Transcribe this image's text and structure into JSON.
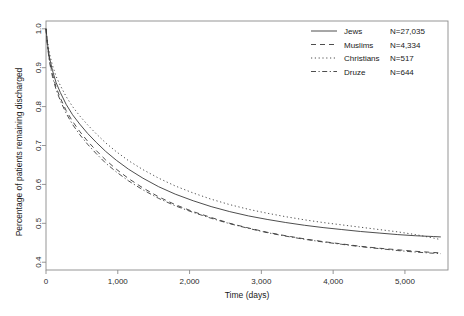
{
  "chart_data": {
    "type": "line",
    "title": "",
    "xlabel": "Time (days)",
    "ylabel": "Percentage of patients remaining discharged",
    "xlim": [
      0,
      5600
    ],
    "ylim": [
      0.38,
      1.02
    ],
    "grid": false,
    "legend_position": "top-right",
    "xticks": [
      0,
      1000,
      2000,
      3000,
      4000,
      5000
    ],
    "xtick_labels": [
      "0",
      "1,000",
      "2,000",
      "3,000",
      "4,000",
      "5,000"
    ],
    "yticks": [
      0.4,
      0.5,
      0.6,
      0.7,
      0.8,
      0.9,
      1.0
    ],
    "ytick_labels": [
      "0.4",
      "0.5",
      "0.6",
      "0.7",
      "0.8",
      "0.9",
      "1.0"
    ],
    "series": [
      {
        "name": "Jews",
        "n_label": "N=27,035",
        "n": 27035,
        "line_style": "solid",
        "color": "#3a3a3a",
        "x": [
          0,
          20,
          50,
          90,
          140,
          200,
          280,
          370,
          470,
          580,
          700,
          830,
          980,
          1150,
          1350,
          1570,
          1800,
          2050,
          2300,
          2560,
          2820,
          3080,
          3340,
          3600,
          3860,
          4120,
          4380,
          4640,
          4900,
          5150,
          5400,
          5500
        ],
        "y": [
          1.0,
          0.962,
          0.925,
          0.893,
          0.862,
          0.836,
          0.806,
          0.779,
          0.755,
          0.731,
          0.708,
          0.685,
          0.662,
          0.639,
          0.616,
          0.594,
          0.575,
          0.558,
          0.543,
          0.53,
          0.519,
          0.51,
          0.502,
          0.495,
          0.489,
          0.484,
          0.479,
          0.475,
          0.471,
          0.468,
          0.466,
          0.465
        ]
      },
      {
        "name": "Muslims",
        "n_label": "N=4,334",
        "n": 4334,
        "line_style": "dashed",
        "color": "#3a3a3a",
        "x": [
          0,
          20,
          50,
          90,
          140,
          200,
          280,
          370,
          470,
          580,
          700,
          830,
          980,
          1150,
          1350,
          1570,
          1800,
          2050,
          2300,
          2560,
          2820,
          3080,
          3340,
          3600,
          3860,
          4120,
          4380,
          4640,
          4900,
          5150,
          5400,
          5500
        ],
        "y": [
          1.0,
          0.958,
          0.918,
          0.883,
          0.85,
          0.822,
          0.79,
          0.762,
          0.736,
          0.711,
          0.687,
          0.663,
          0.639,
          0.615,
          0.591,
          0.568,
          0.548,
          0.53,
          0.515,
          0.5,
          0.488,
          0.477,
          0.468,
          0.46,
          0.453,
          0.447,
          0.441,
          0.436,
          0.432,
          0.428,
          0.425,
          0.424
        ]
      },
      {
        "name": "Christians",
        "n_label": "N=517",
        "n": 517,
        "line_style": "dotted",
        "color": "#3a3a3a",
        "x": [
          0,
          20,
          50,
          90,
          140,
          200,
          280,
          370,
          470,
          580,
          700,
          830,
          980,
          1150,
          1350,
          1570,
          1800,
          2050,
          2300,
          2560,
          2820,
          3080,
          3340,
          3600,
          3860,
          4120,
          4380,
          4640,
          4900,
          5150,
          5400,
          5500
        ],
        "y": [
          1.0,
          0.968,
          0.935,
          0.906,
          0.878,
          0.854,
          0.826,
          0.8,
          0.776,
          0.753,
          0.73,
          0.707,
          0.684,
          0.661,
          0.638,
          0.616,
          0.596,
          0.578,
          0.562,
          0.548,
          0.536,
          0.526,
          0.517,
          0.509,
          0.502,
          0.496,
          0.49,
          0.484,
          0.478,
          0.471,
          0.462,
          0.458
        ]
      },
      {
        "name": "Druze",
        "n_label": "N=644",
        "n": 644,
        "line_style": "dashdot",
        "color": "#3a3a3a",
        "x": [
          0,
          20,
          50,
          90,
          140,
          200,
          280,
          370,
          470,
          580,
          700,
          830,
          980,
          1150,
          1350,
          1570,
          1800,
          2050,
          2300,
          2560,
          2820,
          3080,
          3340,
          3600,
          3860,
          4120,
          4380,
          4640,
          4900,
          5150,
          5400,
          5500
        ],
        "y": [
          1.0,
          0.955,
          0.913,
          0.877,
          0.844,
          0.815,
          0.783,
          0.754,
          0.728,
          0.703,
          0.679,
          0.655,
          0.632,
          0.609,
          0.586,
          0.564,
          0.545,
          0.528,
          0.513,
          0.499,
          0.487,
          0.476,
          0.467,
          0.459,
          0.452,
          0.446,
          0.44,
          0.435,
          0.43,
          0.426,
          0.423,
          0.422
        ]
      }
    ]
  }
}
